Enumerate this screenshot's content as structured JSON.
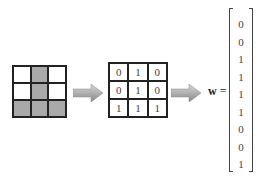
{
  "image_grid": {
    "rows": [
      [
        "white",
        "gray",
        "white"
      ],
      [
        "white",
        "gray",
        "white"
      ],
      [
        "gray",
        "gray",
        "gray"
      ]
    ],
    "colors": {
      "white": "#ffffff",
      "gray": "#a9a9a9"
    }
  },
  "matrix": {
    "rows": [
      [
        "0",
        "1",
        "0"
      ],
      [
        "0",
        "1",
        "0"
      ],
      [
        "1",
        "1",
        "1"
      ]
    ]
  },
  "arrows": [
    "right-arrow",
    "right-arrow"
  ],
  "equation": {
    "symbol": "w",
    "equals": "="
  },
  "vector": {
    "values": [
      "0",
      "0",
      "1",
      "1",
      "1",
      "1",
      "0",
      "0",
      "1"
    ]
  }
}
